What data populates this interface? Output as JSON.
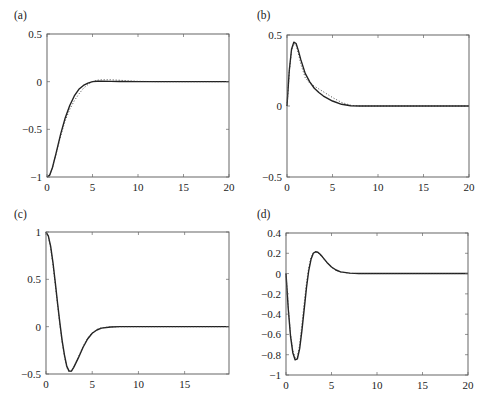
{
  "chart_data": [
    {
      "panel": "(a)",
      "type": "line",
      "title": "",
      "xlabel": "",
      "ylabel": "",
      "xlim": [
        0,
        20
      ],
      "ylim": [
        -1,
        0.5
      ],
      "xticks": [
        0,
        5,
        10,
        15,
        20
      ],
      "xtick_labels": [
        "0",
        "5",
        "10",
        "15",
        "20"
      ],
      "yticks": [
        -1,
        -0.5,
        0,
        0.5
      ],
      "ytick_labels": [
        "−1",
        "−0.5",
        "0",
        "0.5"
      ],
      "grid": false,
      "legend": null,
      "box": {
        "left": 47,
        "top": 34,
        "right": 229,
        "bottom": 177
      },
      "series": [
        {
          "name": "solid",
          "style": "solid",
          "x": [
            0,
            0.3,
            0.6,
            1,
            1.5,
            2,
            2.5,
            3,
            3.5,
            4,
            4.5,
            5,
            5.5,
            6,
            7,
            8,
            10,
            12,
            15,
            20
          ],
          "y": [
            -1,
            -0.98,
            -0.9,
            -0.75,
            -0.55,
            -0.38,
            -0.25,
            -0.15,
            -0.08,
            -0.04,
            -0.015,
            0,
            0.005,
            0.005,
            0.003,
            0.001,
            0,
            0,
            0,
            0
          ]
        },
        {
          "name": "dotted",
          "style": "dotted",
          "x": [
            0,
            0.3,
            0.6,
            1,
            1.5,
            2,
            2.5,
            3,
            3.5,
            4,
            4.5,
            5,
            5.5,
            6,
            7,
            8,
            9,
            10,
            12,
            15,
            20
          ],
          "y": [
            -1,
            -0.98,
            -0.9,
            -0.76,
            -0.57,
            -0.41,
            -0.29,
            -0.2,
            -0.13,
            -0.07,
            -0.03,
            0,
            0.015,
            0.02,
            0.02,
            0.015,
            0.008,
            0.004,
            0,
            0,
            0
          ]
        }
      ]
    },
    {
      "panel": "(b)",
      "type": "line",
      "title": "",
      "xlabel": "",
      "ylabel": "",
      "xlim": [
        0,
        20
      ],
      "ylim": [
        -0.5,
        0.5
      ],
      "xticks": [
        0,
        5,
        10,
        15,
        20
      ],
      "xtick_labels": [
        "0",
        "5",
        "10",
        "15",
        "20"
      ],
      "yticks": [
        -0.5,
        0,
        0.5
      ],
      "ytick_labels": [
        "−0.5",
        "0",
        "0.5"
      ],
      "grid": false,
      "legend": null,
      "box": {
        "left": 287,
        "top": 35,
        "right": 469,
        "bottom": 177
      },
      "series": [
        {
          "name": "solid",
          "style": "solid",
          "x": [
            0,
            0.25,
            0.5,
            0.75,
            1,
            1.25,
            1.5,
            2,
            2.5,
            3,
            3.5,
            4,
            5,
            6,
            7,
            8,
            10,
            15,
            20
          ],
          "y": [
            0,
            0.25,
            0.4,
            0.45,
            0.44,
            0.39,
            0.33,
            0.23,
            0.17,
            0.125,
            0.095,
            0.07,
            0.035,
            0.012,
            0.002,
            0,
            0,
            0,
            0
          ]
        },
        {
          "name": "dotted",
          "style": "dotted",
          "x": [
            0,
            0.25,
            0.5,
            0.75,
            1,
            1.25,
            1.5,
            2,
            2.5,
            3,
            3.5,
            4,
            5,
            6,
            7,
            8,
            10,
            15,
            20
          ],
          "y": [
            0,
            0.24,
            0.39,
            0.44,
            0.43,
            0.37,
            0.3,
            0.2,
            0.16,
            0.14,
            0.12,
            0.1,
            0.06,
            0.025,
            0.005,
            0,
            0,
            0,
            0
          ]
        }
      ]
    },
    {
      "panel": "(c)",
      "type": "line",
      "title": "",
      "xlabel": "",
      "ylabel": "",
      "xlim": [
        0,
        19.8
      ],
      "ylim": [
        -0.5,
        1
      ],
      "xticks": [
        0,
        5,
        10,
        15
      ],
      "xtick_labels": [
        "0",
        "5",
        "10",
        "15"
      ],
      "yticks": [
        -0.5,
        0,
        0.5,
        1
      ],
      "ytick_labels": [
        "−0.5",
        "0",
        "0.5",
        "1"
      ],
      "grid": false,
      "legend": null,
      "box": {
        "left": 46,
        "top": 232,
        "right": 229,
        "bottom": 374
      },
      "series": [
        {
          "name": "solid",
          "style": "solid",
          "x": [
            0,
            0.25,
            0.5,
            0.75,
            1,
            1.25,
            1.5,
            1.75,
            2,
            2.25,
            2.5,
            2.75,
            3,
            3.5,
            4,
            4.5,
            5,
            5.5,
            6,
            7,
            8,
            10,
            15,
            19.8
          ],
          "y": [
            1,
            0.96,
            0.85,
            0.68,
            0.47,
            0.25,
            0.04,
            -0.15,
            -0.3,
            -0.42,
            -0.47,
            -0.47,
            -0.43,
            -0.33,
            -0.22,
            -0.13,
            -0.07,
            -0.035,
            -0.015,
            -0.003,
            0,
            0,
            0,
            0
          ]
        },
        {
          "name": "dotted",
          "style": "dotted",
          "x": [
            0,
            0.25,
            0.5,
            0.75,
            1,
            1.25,
            1.5,
            1.75,
            2,
            2.25,
            2.5,
            2.75,
            3,
            3.5,
            4,
            4.5,
            5,
            5.5,
            6,
            7,
            8,
            10,
            15,
            19.8
          ],
          "y": [
            1,
            0.95,
            0.83,
            0.66,
            0.45,
            0.23,
            0.02,
            -0.17,
            -0.32,
            -0.43,
            -0.48,
            -0.47,
            -0.43,
            -0.32,
            -0.21,
            -0.12,
            -0.065,
            -0.03,
            -0.012,
            -0.002,
            0,
            0,
            0,
            0
          ]
        }
      ]
    },
    {
      "panel": "(d)",
      "type": "line",
      "title": "",
      "xlabel": "",
      "ylabel": "",
      "xlim": [
        0,
        20
      ],
      "ylim": [
        -1,
        0.4
      ],
      "xticks": [
        0,
        5,
        10,
        15,
        20
      ],
      "xtick_labels": [
        "0",
        "5",
        "10",
        "15",
        "20"
      ],
      "yticks": [
        -1,
        -0.8,
        -0.6,
        -0.4,
        -0.2,
        0,
        0.2,
        0.4
      ],
      "ytick_labels": [
        "−1",
        "−0.8",
        "−0.6",
        "−0.4",
        "−0.2",
        "0",
        "0.2",
        "0.4"
      ],
      "grid": false,
      "legend": null,
      "box": {
        "left": 286,
        "top": 233,
        "right": 468,
        "bottom": 375
      },
      "series": [
        {
          "name": "solid",
          "style": "solid",
          "x": [
            0,
            0.25,
            0.5,
            0.75,
            1,
            1.25,
            1.5,
            1.75,
            2,
            2.25,
            2.5,
            2.75,
            3,
            3.25,
            3.5,
            3.75,
            4,
            4.5,
            5,
            5.5,
            6,
            7,
            8,
            10,
            15,
            20
          ],
          "y": [
            0,
            -0.35,
            -0.62,
            -0.78,
            -0.85,
            -0.84,
            -0.74,
            -0.56,
            -0.35,
            -0.14,
            0.03,
            0.14,
            0.2,
            0.215,
            0.21,
            0.19,
            0.165,
            0.11,
            0.065,
            0.035,
            0.017,
            0.004,
            0.001,
            0,
            0,
            0
          ]
        },
        {
          "name": "dotted",
          "style": "dotted",
          "x": [
            0,
            0.25,
            0.5,
            0.75,
            1,
            1.25,
            1.5,
            1.75,
            2,
            2.25,
            2.5,
            2.75,
            3,
            3.25,
            3.5,
            3.75,
            4,
            4.5,
            5,
            5.5,
            6,
            7,
            8,
            10,
            15,
            20
          ],
          "y": [
            0,
            -0.33,
            -0.6,
            -0.76,
            -0.83,
            -0.82,
            -0.7,
            -0.5,
            -0.29,
            -0.09,
            0.06,
            0.16,
            0.205,
            0.215,
            0.205,
            0.185,
            0.16,
            0.105,
            0.06,
            0.03,
            0.015,
            0.003,
            0,
            0,
            0,
            0
          ]
        }
      ]
    }
  ],
  "panels": [
    {
      "label": "(a)"
    },
    {
      "label": "(b)"
    },
    {
      "label": "(c)"
    },
    {
      "label": "(d)"
    }
  ]
}
